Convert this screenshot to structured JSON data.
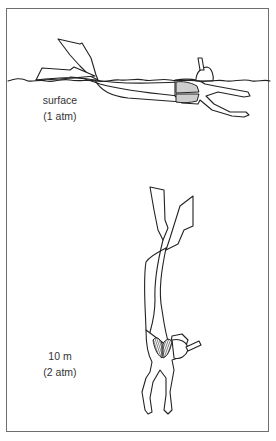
{
  "diagram": {
    "title": "",
    "panels": [
      {
        "id": "surface",
        "label_line1": "surface",
        "label_line2": "(1 atm)",
        "figure": "snorkeler floating horizontally at water surface, lungs full size (shaded)"
      },
      {
        "id": "depth",
        "label_line1": "10 m",
        "label_line2": "(2 atm)",
        "figure": "diver descending head-down, lungs compressed to half volume (shaded)"
      }
    ],
    "colors": {
      "stroke": "#222222",
      "frame": "#6e6e6e",
      "lung_fill_surface": "#cfcfcf",
      "lung_fill_depth": "#555555",
      "text": "#333333"
    }
  }
}
